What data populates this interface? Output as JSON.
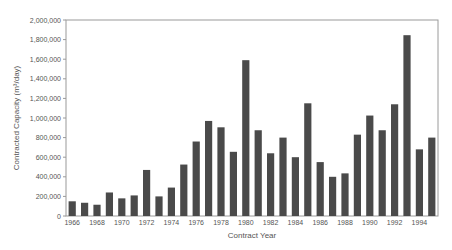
{
  "chart_data": {
    "type": "bar",
    "title": "",
    "xlabel": "Contract Year",
    "ylabel": "Contracted Capacity (m³/day)",
    "ylim": [
      0,
      2000000
    ],
    "yticks": [
      0,
      200000,
      400000,
      600000,
      800000,
      1000000,
      1200000,
      1400000,
      1600000,
      1800000,
      2000000
    ],
    "ytick_labels": [
      "0",
      "200,000",
      "400,000",
      "600,000",
      "800,000",
      "1,000,000",
      "1,200,000",
      "1,400,000",
      "1,600,000",
      "1,800,000",
      "2,000,000"
    ],
    "xtick_labels": [
      "1966",
      "1968",
      "1970",
      "1972",
      "1974",
      "1976",
      "1978",
      "1980",
      "1982",
      "1984",
      "1986",
      "1988",
      "1990",
      "1992",
      "1994"
    ],
    "grid": false,
    "legend": null,
    "bar_color": "#4a4a4a",
    "categories": [
      "1966",
      "1967",
      "1968",
      "1969",
      "1970",
      "1971",
      "1972",
      "1973",
      "1974",
      "1975",
      "1976",
      "1977",
      "1978",
      "1979",
      "1980",
      "1981",
      "1982",
      "1983",
      "1984",
      "1985",
      "1986",
      "1987",
      "1988",
      "1989",
      "1990",
      "1991",
      "1992",
      "1993",
      "1994",
      "1995"
    ],
    "values": [
      150000,
      135000,
      115000,
      240000,
      180000,
      210000,
      470000,
      200000,
      290000,
      525000,
      760000,
      970000,
      905000,
      655000,
      1590000,
      875000,
      640000,
      800000,
      600000,
      1150000,
      550000,
      400000,
      435000,
      830000,
      1025000,
      875000,
      1140000,
      1845000,
      680000,
      800000
    ]
  }
}
